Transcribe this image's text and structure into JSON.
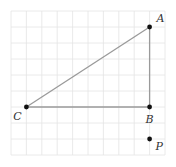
{
  "diagram": {
    "title": "",
    "grid": {
      "columns": 10,
      "rows": 9
    },
    "colors": {
      "grid": "#e4e4e4",
      "segment": "#9a9a9a",
      "point": "#111111",
      "label": "#333333"
    },
    "points": [
      {
        "id": "A",
        "label": "A",
        "col": 9,
        "row": 1,
        "label_pos": "upper-right"
      },
      {
        "id": "B",
        "label": "B",
        "col": 9,
        "row": 6,
        "label_pos": "below"
      },
      {
        "id": "C",
        "label": "C",
        "col": 1,
        "row": 6,
        "label_pos": "lower-left"
      },
      {
        "id": "P",
        "label": "P",
        "col": 9,
        "row": 8,
        "label_pos": "lower-right"
      }
    ],
    "segments": [
      {
        "from": "C",
        "to": "A"
      },
      {
        "from": "A",
        "to": "B"
      },
      {
        "from": "C",
        "to": "B"
      }
    ]
  }
}
